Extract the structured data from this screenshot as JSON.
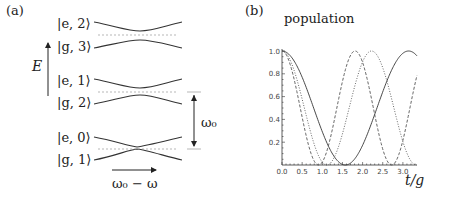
{
  "panel_a": {
    "label": "(a)",
    "levels": [
      {
        "upper": "|e, 2⟩",
        "lower": "|g, 3⟩"
      },
      {
        "upper": "|e, 1⟩",
        "lower": "|g, 2⟩"
      },
      {
        "upper": "|e, 0⟩",
        "lower": "|g, 1⟩"
      }
    ],
    "energy_axis_label": "E",
    "spacing_label": "ω₀",
    "detuning_label": "ω₀ − ω"
  },
  "panel_b": {
    "label": "(b)"
  },
  "chart_data": {
    "type": "line",
    "title": "population",
    "xlabel": "t/g",
    "ylabel": "",
    "xlim": [
      0,
      3.35
    ],
    "ylim": [
      0,
      1.0
    ],
    "x_ticks": [
      "0.0",
      "0.5",
      "1.0",
      "1.5",
      "2.0",
      "2.5",
      "3.0"
    ],
    "y_ticks": [
      "0.2",
      "0.4",
      "0.6",
      "0.8",
      "1.0"
    ],
    "grid": false,
    "legend": "none",
    "series": [
      {
        "name": "solid",
        "style": "solid",
        "function": "cos^2(t)",
        "omega": 1.0,
        "x": [
          0,
          0.5,
          1.0,
          1.57,
          2.0,
          2.5,
          3.14,
          3.35
        ],
        "values": [
          1.0,
          0.77,
          0.29,
          0.0,
          0.17,
          0.64,
          1.0,
          0.96
        ]
      },
      {
        "name": "dotted",
        "style": "dotted",
        "function": "cos^2(sqrt(2) t)",
        "omega": 1.414,
        "x": [
          0,
          0.5,
          1.11,
          1.5,
          2.22,
          2.8,
          3.33
        ],
        "values": [
          1.0,
          0.57,
          0.0,
          0.28,
          1.0,
          0.39,
          0.0
        ]
      },
      {
        "name": "dashed",
        "style": "dashed",
        "function": "cos^2(sqrt(3) t)",
        "omega": 1.732,
        "x": [
          0,
          0.5,
          0.91,
          1.3,
          1.81,
          2.3,
          2.72,
          3.35
        ],
        "values": [
          1.0,
          0.42,
          0.0,
          0.39,
          1.0,
          0.45,
          0.0,
          0.74
        ]
      }
    ]
  }
}
